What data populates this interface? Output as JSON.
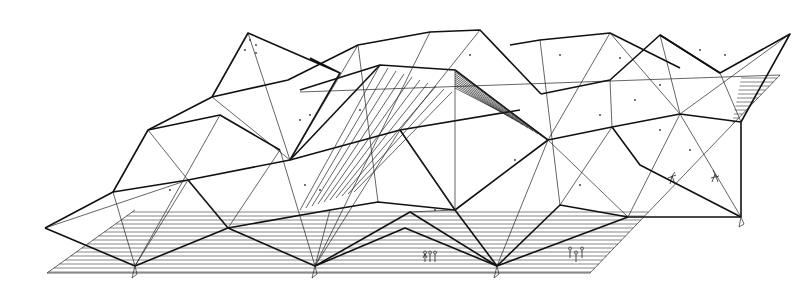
{
  "title": "",
  "colors": {
    "ink": "#111111",
    "background": "#ffffff"
  },
  "figures": [
    {
      "name": "people-group-left"
    },
    {
      "name": "people-group-right"
    },
    {
      "name": "person-on-slab"
    },
    {
      "name": "person-standing-right"
    }
  ]
}
